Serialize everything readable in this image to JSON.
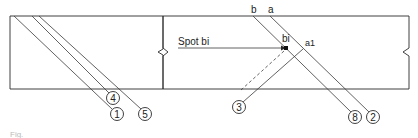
{
  "figure": {
    "caption_fragment": "Fig."
  },
  "left_panel": {
    "callouts": [
      {
        "id": "4",
        "label": "4"
      },
      {
        "id": "1",
        "label": "1"
      },
      {
        "id": "5",
        "label": "5"
      }
    ]
  },
  "right_panel": {
    "top_labels": {
      "b": "b",
      "a": "a"
    },
    "spot_label": "Spot bi",
    "point_labels": {
      "bi": "bi",
      "a1": "a1"
    },
    "callouts": [
      {
        "id": "3",
        "label": "3"
      },
      {
        "id": "8",
        "label": "8"
      },
      {
        "id": "2",
        "label": "2"
      }
    ]
  },
  "colors": {
    "line": "#2a2a2a",
    "background": "#ffffff"
  }
}
